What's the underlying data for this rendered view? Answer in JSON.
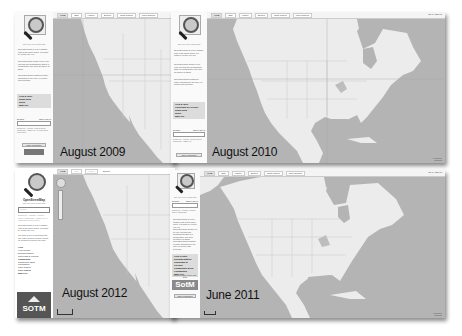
{
  "composite": {
    "description": "Four OpenStreetMap website screenshots from different years arranged as overlapping windows",
    "background": "#ffffff"
  },
  "frames": [
    {
      "id": "aug2009",
      "caption": "August 2009",
      "logo": {
        "title": "OpenStreetMap",
        "subtitle": "The Free Wiki World Map"
      },
      "tabs": [
        "View",
        "Edit",
        "History",
        "Export",
        "GPS Traces",
        "User Diaries"
      ],
      "active_tab": "View",
      "blurb": [
        "OpenStreetMap is a free editable map of the whole world. It is made by people like you.",
        "OpenStreetMap allows you to view, edit and use geographical data in a collaborative way from anywhere on Earth.",
        "OpenStreetMap's hosting is kindly supported by the UCL VR Centre and bytemark."
      ],
      "links": [
        "Help & Wiki",
        "News blog",
        "Shop",
        "Map key"
      ],
      "search": {
        "label": "Search",
        "hint": "where am I?",
        "example": "Examples: 'Alkmaar', 'Regent Street, Cambridge', 'CB2 5AQ', or 'post offices near Lünen'"
      },
      "buttons": [
        "Make a Donation"
      ]
    },
    {
      "id": "aug2010",
      "caption": "August 2010",
      "logo": {
        "title": "OpenStreetMap",
        "subtitle": "The Free Wiki World Map"
      },
      "tabs": [
        "View",
        "Edit",
        "History",
        "Export",
        "GPS Traces",
        "User Diaries"
      ],
      "active_tab": "View",
      "login": "log in | sign up",
      "blurb": [
        "OpenStreetMap is a free editable map of the whole world. It is made by people like you.",
        "OpenStreetMap allows you to view, edit and use geographical data in a collaborative way from anywhere on Earth.",
        "OpenStreetMap's hosting is kindly supported by the UCL VR Centre and bytemark."
      ],
      "links": [
        "Help & Wiki",
        "Copyright & License",
        "News blog",
        "Shop",
        "Map key"
      ],
      "search": {
        "label": "Search",
        "hint": "where am I?",
        "example": "Examples: 'Alkmaar', 'Regent Street, Cambridge', 'CB2 5AQ'"
      },
      "buttons": [
        "Make a Donation"
      ],
      "attribution": "Permalink Shortlink"
    },
    {
      "id": "jun2011",
      "caption": "June 2011",
      "logo": {
        "title": "OpenStreetMap",
        "subtitle": "The Free Wiki World Map"
      },
      "tabs": [
        "View",
        "Edit",
        "History",
        "Export",
        "GPS Traces",
        "User Diaries"
      ],
      "active_tab": "View",
      "login": "log in | sign up",
      "search": {
        "label": "Search",
        "hint": "where am I?",
        "example": "Examples: 'Alkmaar', 'Regent Street, Cambridge'"
      },
      "blurb": [
        "OpenStreetMap is a free editable map of the whole world. It is made by people like you.",
        "OpenStreetMap allows you to view, edit and use geographical data in a collaborative way from anywhere on Earth.",
        "OpenStreetMap's hosting is kindly supported by the UCL VR Centre and bytemark."
      ],
      "links": [
        "Help Centre",
        "Documentation",
        "Copyright & License",
        "Community Blog",
        "Foundation",
        "Map Key"
      ],
      "banner": {
        "lead": "Come to State of the Map 2011",
        "logo": "SotM"
      },
      "buttons": [
        "Make a Donation"
      ],
      "attribution": "Permalink Shortlink"
    },
    {
      "id": "aug2012",
      "caption": "August 2012",
      "logo": {
        "title": "OpenStreetMap",
        "subtitle": "The Free Wiki World Map"
      },
      "tabs": [
        "View",
        "Edit",
        "History",
        "Export"
      ],
      "active_tab": "View",
      "search": {
        "placeholder": "Search",
        "example": "Examples: 'Alkmaar', 'Regent Street, Cambridge', 'CB2 5AQ', or 'post offices near Lünen'"
      },
      "blurb": [
        "OpenStreetMap is a free editable map of the whole world. It is made by people like you.",
        "The data is free to download and use under its open license. Create an account to improve the map."
      ],
      "links": [
        "Help",
        "Help Centre",
        "Documentation",
        "Copyright & License",
        "Community",
        "Community Blog",
        "Foundation",
        "User Diaries",
        "GPS Traces",
        "Map Key"
      ],
      "banner": {
        "logo": "SOTM"
      }
    }
  ],
  "colors": {
    "map_water": "#b4b4b4",
    "map_land": "#ececec",
    "sidebar_bg": "#fafafa",
    "linkbox_bg": "#dcdcdc",
    "caption_text": "#111111"
  }
}
